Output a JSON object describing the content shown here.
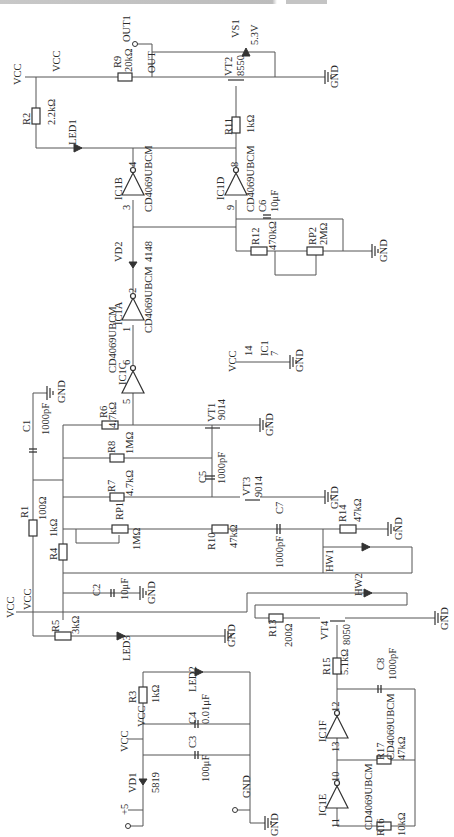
{
  "diagram": {
    "type": "circuit-schematic",
    "orientation": "rotated-90",
    "nets": {
      "vcc": "VCC",
      "gnd": "GND",
      "plus5": "+5",
      "out": "OUT",
      "out_port": "OUT1"
    },
    "components": {
      "R1": {
        "ref": "R1",
        "value": "100Ω"
      },
      "R2": {
        "ref": "R2",
        "value": "2.2kΩ"
      },
      "R3": {
        "ref": "R3",
        "value": "1kΩ"
      },
      "R4": {
        "ref": "R4",
        "value": "1kΩ"
      },
      "R5": {
        "ref": "R5",
        "value": "3kΩ"
      },
      "R6": {
        "ref": "R6",
        "value": "4.7kΩ"
      },
      "R7": {
        "ref": "R7",
        "value": "4.7kΩ"
      },
      "R8": {
        "ref": "R8",
        "value": "1MΩ"
      },
      "R9": {
        "ref": "R9",
        "value": "20kΩ"
      },
      "R10": {
        "ref": "R10",
        "value": "47kΩ"
      },
      "R11": {
        "ref": "R11",
        "value": "1kΩ"
      },
      "R12": {
        "ref": "R12",
        "value": "470kΩ"
      },
      "R13": {
        "ref": "R13",
        "value": "200Ω"
      },
      "R14": {
        "ref": "R14",
        "value": "47kΩ"
      },
      "R15": {
        "ref": "R15",
        "value": "5.1kΩ"
      },
      "R16": {
        "ref": "R16",
        "value": "10kΩ"
      },
      "R17": {
        "ref": "R17",
        "value": "47kΩ"
      },
      "RP1": {
        "ref": "RP1",
        "value": "1MΩ"
      },
      "RP2": {
        "ref": "RP2",
        "value": "2MΩ"
      },
      "C1": {
        "ref": "C1",
        "value": "1000pF"
      },
      "C2": {
        "ref": "C2",
        "value": "10μF"
      },
      "C3": {
        "ref": "C3",
        "value": "100μF"
      },
      "C4": {
        "ref": "C4",
        "value": "0.01μF"
      },
      "C5": {
        "ref": "C5",
        "value": "1000pF"
      },
      "C6": {
        "ref": "C6",
        "value": "10μF"
      },
      "C7": {
        "ref": "C7",
        "value": "1000pF"
      },
      "C8": {
        "ref": "C8",
        "value": "1000pF"
      },
      "VD1": {
        "ref": "VD1",
        "value": "5819"
      },
      "VD2": {
        "ref": "VD2",
        "value": "4148"
      },
      "VS1": {
        "ref": "VS1",
        "value": "5.3V"
      },
      "VT1": {
        "ref": "VT1",
        "value": "9014"
      },
      "VT2": {
        "ref": "VT2",
        "value": "8550"
      },
      "VT3": {
        "ref": "VT3",
        "value": "9014"
      },
      "VT4": {
        "ref": "VT4",
        "value": "8050"
      },
      "LED1": {
        "ref": "LED1"
      },
      "LED2": {
        "ref": "LED2"
      },
      "LED3": {
        "ref": "LED3"
      },
      "HW1": {
        "ref": "HW1"
      },
      "HW2": {
        "ref": "HW2"
      },
      "IC1": {
        "ref": "IC1",
        "pin_vcc": "14",
        "pin_gnd": "7"
      },
      "IC1A": {
        "ref": "IC1A",
        "part": "CD4069UBCM",
        "pin_in": "1",
        "pin_out": "2"
      },
      "IC1B": {
        "ref": "IC1B",
        "part": "CD4069UBCM",
        "pin_in": "3",
        "pin_out": "4"
      },
      "IC1C": {
        "ref": "IC1C",
        "part": "CD4069UBCM",
        "pin_in": "5",
        "pin_out": "6"
      },
      "IC1D": {
        "ref": "IC1D",
        "part": "CD4069UBCM",
        "pin_in": "9",
        "pin_out": "8"
      },
      "IC1E": {
        "ref": "IC1E",
        "part": "CD4069UBCM",
        "pin_in": "11",
        "pin_out": "10"
      },
      "IC1F": {
        "ref": "IC1F",
        "part": "CD4069UBCM",
        "pin_in": "13",
        "pin_out": "12"
      }
    }
  }
}
